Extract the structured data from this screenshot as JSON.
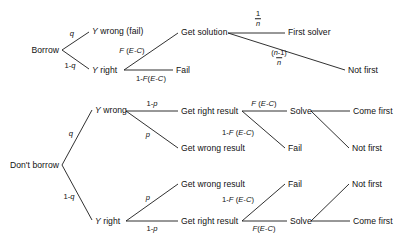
{
  "diagram": {
    "type": "decision-tree",
    "title": "",
    "nodes": {
      "borrow": "Borrow",
      "y_wrong_fail": "Y wrong (fail)",
      "y_right_top": "Y right",
      "get_solution": "Get solution",
      "fail_top": "Fail",
      "first_solver": "First solver",
      "not_first_top": "Not first",
      "dont_borrow": "Don't borrow",
      "y_wrong_mid": "Y wrong",
      "get_right_result_mid": "Get right result",
      "get_wrong_result_mid": "Get wrong result",
      "solve_mid": "Solve",
      "fail_mid": "Fail",
      "come_first_mid": "Come first",
      "not_first_mid": "Not first",
      "y_right_bot": "Y right",
      "get_wrong_result_bot": "Get wrong result",
      "get_right_result_bot": "Get right result",
      "solve_bot": "Solve",
      "fail_bot": "Fail",
      "not_first_bot": "Not first",
      "come_first_bot": "Come first"
    },
    "edge_labels": {
      "q_top": "q",
      "one_minus_q_top": "1-q",
      "f_ec_top": "F (E-C)",
      "one_minus_f_ec_top": "1-F(E-C)",
      "one_over_n_num": "1",
      "one_over_n_den": "n",
      "n_minus_one_num": "(n-1)",
      "n_minus_one_den": "n",
      "q_mid": "q",
      "one_minus_q_bot": "1-q",
      "one_minus_p_mid": "1-p",
      "p_mid": "p",
      "f_ec_mid": "F (E-C)",
      "one_minus_f_ec_mid": "1-F (E-C)",
      "p_bot": "p",
      "one_minus_p_bot": "1-p",
      "f_ec_bot": "F(E-C)",
      "one_minus_f_ec_bot": "1-F (E-C)"
    },
    "colors": {
      "line": "#1a1a1a",
      "text": "#111111",
      "background": "#ffffff"
    }
  }
}
